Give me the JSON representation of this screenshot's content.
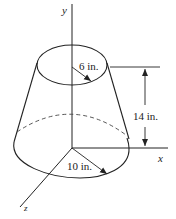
{
  "diagram": {
    "type": "frustum-of-cone",
    "axes": {
      "x_label": "x",
      "y_label": "y",
      "z_label": "z"
    },
    "dimensions": {
      "top_radius": "6 in.",
      "bottom_radius": "10 in.",
      "height": "14 in."
    },
    "colors": {
      "line": "#222222",
      "background": "#ffffff"
    }
  }
}
